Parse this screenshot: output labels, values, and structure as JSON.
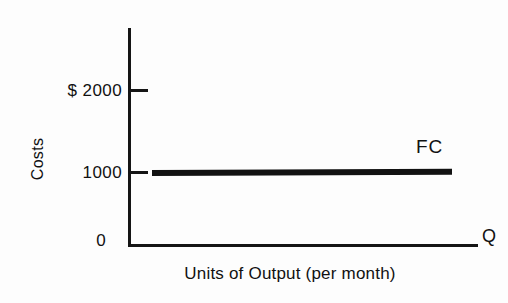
{
  "chart_data": {
    "type": "line",
    "title": "",
    "subtitle": "",
    "xlabel": "Units of Output (per month)",
    "ylabel": "Costs",
    "x_axis_end_symbol": "Q",
    "grid": false,
    "legend_position": "inline-right",
    "xlim": [
      0,
      100
    ],
    "ylim": [
      0,
      2600
    ],
    "ytick_labels": [
      "$ 2000",
      "1000",
      "0"
    ],
    "ytick_values": [
      2000,
      1000,
      0
    ],
    "xtick_labels": [],
    "series": [
      {
        "name": "FC",
        "annotation": "FC",
        "values": [
          1000,
          1000
        ],
        "x": [
          8,
          92
        ],
        "style": "thick-solid-black"
      }
    ],
    "colors": {
      "line": "#121212",
      "axis": "#151515",
      "text": "#111111",
      "background": "#fdfdfd"
    }
  },
  "axes": {
    "y_ticks": [
      {
        "label": "$ 2000",
        "value": 2000
      },
      {
        "label": "1000",
        "value": 1000
      },
      {
        "label": "0",
        "value": 0
      }
    ],
    "y_title": "Costs",
    "x_title": "Units of Output (per month)",
    "x_end_symbol": "Q"
  },
  "annotations": {
    "fixed_cost_label": "FC"
  }
}
